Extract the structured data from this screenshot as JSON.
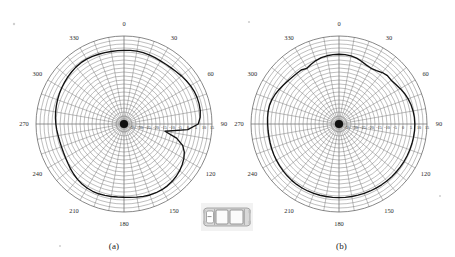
{
  "figure": {
    "panels": [
      {
        "caption": "(a)",
        "angle_labels": [
          "0",
          "30",
          "60",
          "90",
          "120",
          "150",
          "180",
          "210",
          "240",
          "270",
          "300",
          "330"
        ],
        "radial_labels": [
          "-35",
          "-30",
          "-25",
          "-20",
          "-15",
          "-10",
          "-5",
          "0",
          "5",
          "10",
          "15"
        ]
      },
      {
        "caption": "(b)",
        "angle_labels": [
          "0",
          "30",
          "60",
          "90",
          "120",
          "150",
          "180",
          "210",
          "240",
          "270",
          "300",
          "330"
        ],
        "radial_labels": [
          "-35",
          "-30",
          "-25",
          "-20",
          "-15",
          "-10",
          "-5",
          "0",
          "5",
          "10",
          "15"
        ]
      }
    ],
    "center_icon": "car-top-view-icon"
  },
  "chart_data": [
    {
      "type": "line",
      "subtype": "polar-antenna-pattern",
      "title": "(a)",
      "xlabel": "Azimuth angle (degrees)",
      "ylabel": "Gain (dB)",
      "angle_unit": "degrees",
      "angle_direction": "clockwise",
      "angle_zero_at": "top",
      "theta_ticks": [
        0,
        30,
        60,
        90,
        120,
        150,
        180,
        210,
        240,
        270,
        300,
        330
      ],
      "r_ticks": [
        -35,
        -30,
        -25,
        -20,
        -15,
        -10,
        -5,
        0,
        5,
        10,
        15
      ],
      "rlim": [
        -40,
        15
      ],
      "grid": true,
      "legend": null,
      "series": [
        {
          "name": "Measured gain (a)",
          "theta": [
            0,
            5,
            10,
            15,
            20,
            25,
            30,
            35,
            40,
            45,
            50,
            55,
            60,
            65,
            70,
            75,
            80,
            85,
            90,
            95,
            100,
            105,
            110,
            115,
            120,
            125,
            130,
            135,
            140,
            145,
            150,
            155,
            160,
            165,
            170,
            175,
            180,
            185,
            190,
            195,
            200,
            205,
            210,
            215,
            220,
            225,
            230,
            235,
            240,
            245,
            250,
            255,
            260,
            265,
            270,
            275,
            280,
            285,
            290,
            295,
            300,
            305,
            310,
            315,
            320,
            325,
            330,
            335,
            340,
            345,
            350,
            355,
            360
          ],
          "r": [
            6,
            6.2,
            6.3,
            6.2,
            6.0,
            5.8,
            5.6,
            5.6,
            5.8,
            6.2,
            6.8,
            7.4,
            8.0,
            8.4,
            8.6,
            8.6,
            8.4,
            7.8,
            6.4,
            0.0,
            -14.0,
            -6.0,
            -1.0,
            1.6,
            3.2,
            4.4,
            5.4,
            6.2,
            6.8,
            7.2,
            7.4,
            7.4,
            7.2,
            6.8,
            6.4,
            6.0,
            5.8,
            5.8,
            6.0,
            6.2,
            6.4,
            6.4,
            6.2,
            5.8,
            5.2,
            4.4,
            3.6,
            2.8,
            2.2,
            1.8,
            1.6,
            1.6,
            1.8,
            2.2,
            2.6,
            3.0,
            3.4,
            3.8,
            4.2,
            4.6,
            5.0,
            5.4,
            5.8,
            6.2,
            6.6,
            6.8,
            6.8,
            6.6,
            6.4,
            6.2,
            6.0,
            6.0,
            6.0
          ]
        }
      ]
    },
    {
      "type": "line",
      "subtype": "polar-antenna-pattern",
      "title": "(b)",
      "xlabel": "Azimuth angle (degrees)",
      "ylabel": "Gain (dB)",
      "angle_unit": "degrees",
      "angle_direction": "clockwise",
      "angle_zero_at": "top",
      "theta_ticks": [
        0,
        30,
        60,
        90,
        120,
        150,
        180,
        210,
        240,
        270,
        300,
        330
      ],
      "r_ticks": [
        -35,
        -30,
        -25,
        -20,
        -15,
        -10,
        -5,
        0,
        5,
        10,
        15
      ],
      "rlim": [
        -40,
        15
      ],
      "grid": true,
      "legend": null,
      "series": [
        {
          "name": "Measured gain (b)",
          "theta": [
            0,
            5,
            10,
            15,
            20,
            25,
            30,
            35,
            40,
            45,
            50,
            55,
            60,
            65,
            70,
            75,
            80,
            85,
            90,
            95,
            100,
            105,
            110,
            115,
            120,
            125,
            130,
            135,
            140,
            145,
            150,
            155,
            160,
            165,
            170,
            175,
            180,
            185,
            190,
            195,
            200,
            205,
            210,
            215,
            220,
            225,
            230,
            235,
            240,
            245,
            250,
            255,
            260,
            265,
            270,
            275,
            280,
            285,
            290,
            295,
            300,
            305,
            310,
            315,
            320,
            325,
            330,
            335,
            340,
            345,
            350,
            355,
            360
          ],
          "r": [
            3.6,
            3.5,
            3.2,
            2.6,
            1.6,
            0.6,
            0.2,
            0.8,
            2.0,
            2.8,
            2.6,
            3.2,
            4.2,
            5.2,
            6.0,
            6.6,
            7.0,
            7.3,
            7.4,
            7.4,
            7.3,
            7.2,
            7.1,
            7.0,
            6.9,
            6.8,
            6.7,
            6.6,
            6.5,
            6.4,
            6.3,
            6.2,
            6.1,
            6.0,
            6.0,
            6.0,
            6.0,
            6.0,
            6.0,
            6.1,
            6.2,
            6.2,
            6.2,
            6.1,
            6.0,
            5.8,
            5.6,
            5.4,
            5.2,
            5.0,
            4.8,
            4.6,
            4.5,
            4.5,
            4.6,
            4.8,
            5.0,
            5.0,
            4.6,
            4.0,
            3.2,
            2.4,
            1.8,
            1.4,
            1.2,
            1.2,
            0.2,
            1.2,
            2.2,
            2.9,
            3.3,
            3.5,
            3.6
          ]
        }
      ]
    }
  ]
}
